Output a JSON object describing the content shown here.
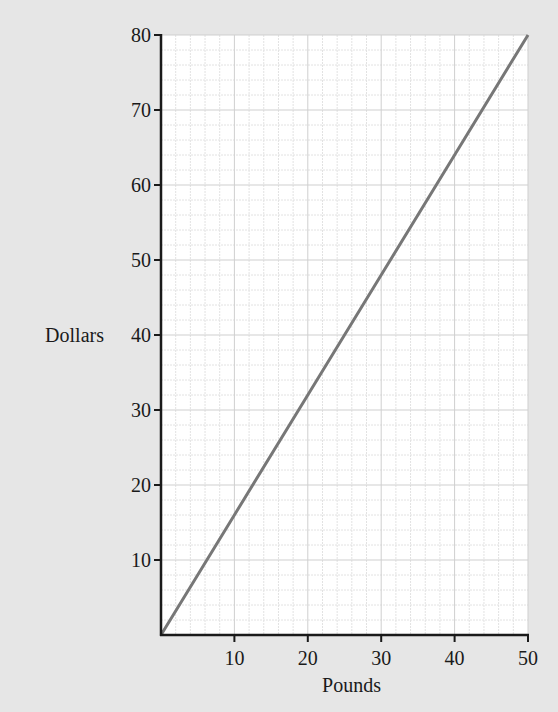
{
  "chart_data": {
    "type": "line",
    "title": "",
    "xlabel": "Pounds",
    "ylabel": "Dollars",
    "xlim": [
      0,
      50
    ],
    "ylim": [
      0,
      80
    ],
    "x_ticks": [
      10,
      20,
      30,
      40,
      50
    ],
    "y_ticks": [
      10,
      20,
      30,
      40,
      50,
      60,
      70,
      80
    ],
    "grid": {
      "on": true,
      "major_step_x": 10,
      "major_step_y": 10,
      "minor_step_x": 2,
      "minor_step_y": 2
    },
    "legend": null,
    "series": [
      {
        "name": "Pounds to Dollars",
        "x": [
          0,
          10,
          20,
          30,
          40,
          50
        ],
        "y": [
          0,
          16,
          32,
          48,
          64,
          80
        ],
        "color": "#777777"
      }
    ]
  },
  "colors": {
    "background": "#e6e6e6",
    "plot_area": "#ffffff",
    "axis": "#1a1a1a",
    "major_grid": "#cfcfcf",
    "minor_grid": "#e2e2e2",
    "line": "#777777"
  }
}
